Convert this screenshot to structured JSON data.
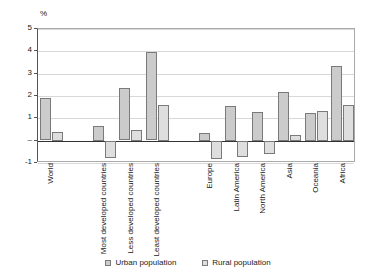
{
  "chart_data": {
    "type": "bar",
    "title": "",
    "subtitle": "",
    "xlabel": "",
    "ylabel": "%",
    "unit_label": "%",
    "ylim": [
      -1,
      5
    ],
    "yticks": [
      "5",
      "4",
      "3",
      "2",
      "1",
      "–",
      "-1"
    ],
    "ytick_values": [
      5,
      4,
      3,
      2,
      1,
      0,
      -1
    ],
    "grid": true,
    "legend_position": "bottom",
    "categories": [
      "World",
      "",
      "Most developed countries",
      "Less developed countries",
      "Least developed countries",
      "",
      "Europe",
      "Latin America",
      "North America",
      "Asia",
      "Oceania",
      "Africa"
    ],
    "series": [
      {
        "name": "Urban population",
        "color": "#cbcbcb",
        "values": [
          1.9,
          null,
          0.65,
          2.35,
          3.95,
          null,
          0.35,
          1.55,
          1.3,
          2.2,
          1.25,
          3.35
        ]
      },
      {
        "name": "Rural population",
        "color": "#dedede",
        "values": [
          0.4,
          null,
          -0.75,
          0.5,
          1.6,
          null,
          -0.8,
          -0.7,
          -0.6,
          0.25,
          1.35,
          1.6
        ]
      }
    ]
  },
  "legend": {
    "entries": [
      {
        "label": "Urban population",
        "swatch": "urban"
      },
      {
        "label": "Rural population",
        "swatch": "rural"
      }
    ]
  }
}
